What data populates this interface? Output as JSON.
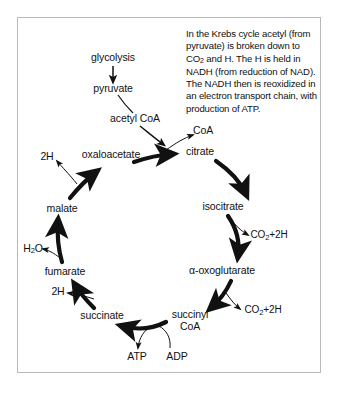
{
  "figure": {
    "frame_color": "#b9b9b9",
    "ink_color": "#111111",
    "background": "#ffffff"
  },
  "caption": {
    "part1": "In the Krebs cycle acetyl (from pyruvate) is broken down to CO",
    "sub1": "2",
    "part2": " and H. The H is held in NADH (from reduction of NAD). The NADH then is reoxidized in an electron transport chain, with production of ATP."
  },
  "entry_pathway": {
    "glycolysis": "glycolysis",
    "pyruvate": "pyruvate",
    "acetyl_coa": "acetyl CoA"
  },
  "cycle": {
    "intermediates": [
      {
        "id": "citrate",
        "label": "citrate",
        "x": 200,
        "y": 152
      },
      {
        "id": "isocitrate",
        "label": "isocitrate",
        "x": 223,
        "y": 207
      },
      {
        "id": "oxoglutarate",
        "label": "α-oxoglutarate",
        "x": 222,
        "y": 271
      },
      {
        "id": "succinyl-coa-line1",
        "label": "succinyl",
        "x": 190,
        "y": 315
      },
      {
        "id": "succinyl-coa-line2",
        "label": "CoA",
        "x": 190,
        "y": 327
      },
      {
        "id": "succinate",
        "label": "succinate",
        "x": 102,
        "y": 316
      },
      {
        "id": "fumarate",
        "label": "fumarate",
        "x": 65,
        "y": 272
      },
      {
        "id": "malate",
        "label": "malate",
        "x": 62,
        "y": 209
      },
      {
        "id": "oxaloacetate",
        "label": "oxaloacetate",
        "x": 111,
        "y": 155
      }
    ]
  },
  "byproducts": {
    "coa": "CoA",
    "hydrogen_top": "2H",
    "hydrogen_bottom": "2H",
    "water": "H",
    "water_sub": "2",
    "water_tail": "O",
    "co2_upper": "CO",
    "co2_upper_sub": "2",
    "co2_upper_tail": "+2H",
    "co2_lower": "CO",
    "co2_lower_sub": "2",
    "co2_lower_tail": "+2H"
  },
  "energy": {
    "atp": "ATP",
    "adp": "ADP"
  }
}
